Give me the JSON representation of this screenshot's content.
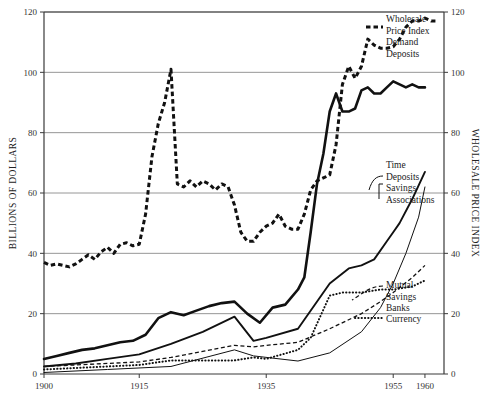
{
  "chart_data": {
    "type": "line",
    "title": "",
    "subtitle": "",
    "ylabel": "BILLIONS OF DOLLARS",
    "y2label": "WHOLESALE PRICE INDEX",
    "xlabel": "",
    "xlim": [
      1900,
      1963
    ],
    "ylim": [
      0,
      120
    ],
    "y2lim": [
      0,
      120
    ],
    "grid": true,
    "legend_position": "inline-right-labels",
    "yticks": [
      0,
      20,
      40,
      60,
      80,
      100,
      120
    ],
    "ytick_labels": [
      "0",
      "20",
      "40",
      "60",
      "80",
      "100",
      "120"
    ],
    "y2ticks": [
      0,
      20,
      40,
      60,
      80,
      100,
      120
    ],
    "y2tick_labels": [
      "0",
      "20",
      "40",
      "60",
      "80",
      "100",
      "120"
    ],
    "xticks": [
      1900,
      1915,
      1935,
      1955,
      1960
    ],
    "xtick_labels": [
      "1900",
      "1915",
      "1935",
      "1955",
      "1960"
    ],
    "series": [
      {
        "name": "Wholesale Price Index",
        "label": "Wholesale\nPrice Index",
        "style": "dashed-thick",
        "axis": "right",
        "color": "#111111",
        "x": [
          1900,
          1901,
          1902,
          1903,
          1904,
          1905,
          1906,
          1907,
          1908,
          1909,
          1910,
          1911,
          1912,
          1913,
          1914,
          1915,
          1916,
          1917,
          1918,
          1919,
          1920,
          1921,
          1922,
          1923,
          1924,
          1925,
          1926,
          1927,
          1928,
          1929,
          1930,
          1931,
          1932,
          1933,
          1934,
          1935,
          1936,
          1937,
          1938,
          1939,
          1940,
          1941,
          1942,
          1943,
          1944,
          1945,
          1946,
          1947,
          1948,
          1949,
          1950,
          1951,
          1952,
          1953,
          1954,
          1955,
          1956,
          1957,
          1958,
          1959,
          1960,
          1961,
          1962
        ],
        "values": [
          37,
          36,
          36.5,
          36,
          35.5,
          36.5,
          38,
          39.5,
          38,
          40.5,
          42,
          40,
          43,
          43.5,
          42.5,
          43,
          53,
          72,
          83,
          90,
          101,
          63,
          62,
          64,
          62,
          64,
          63,
          61,
          63,
          62,
          56,
          47,
          44,
          44,
          47,
          49,
          50,
          53,
          49,
          48,
          48,
          53,
          61,
          64,
          65,
          66,
          76,
          96,
          102,
          98,
          102,
          111,
          109,
          108,
          108,
          108.5,
          111,
          115,
          117,
          117,
          118,
          117,
          117
        ]
      },
      {
        "name": "Demand Deposits",
        "label": "Demand\nDeposits",
        "style": "solid-thick",
        "axis": "left",
        "color": "#111111",
        "x": [
          1900,
          1902,
          1904,
          1906,
          1908,
          1910,
          1912,
          1914,
          1916,
          1918,
          1920,
          1922,
          1924,
          1926,
          1928,
          1930,
          1932,
          1934,
          1936,
          1938,
          1940,
          1941,
          1942,
          1943,
          1944,
          1945,
          1946,
          1947,
          1948,
          1949,
          1950,
          1951,
          1952,
          1953,
          1954,
          1955,
          1956,
          1957,
          1958,
          1959,
          1960
        ],
        "values": [
          5,
          6,
          7,
          8,
          8.5,
          9.5,
          10.5,
          11,
          13,
          18.5,
          20.5,
          19.5,
          21,
          22.5,
          23.5,
          24,
          20,
          17,
          22,
          23,
          28,
          32,
          47,
          63,
          73,
          87,
          93,
          87,
          87,
          88,
          94,
          95,
          93,
          93,
          95,
          97,
          96,
          95,
          96,
          95,
          95
        ]
      },
      {
        "name": "Time Deposits",
        "label": "Time\nDeposits",
        "style": "solid-medium",
        "axis": "left",
        "color": "#111111",
        "x": [
          1900,
          1905,
          1910,
          1915,
          1920,
          1925,
          1930,
          1933,
          1935,
          1940,
          1945,
          1948,
          1950,
          1952,
          1954,
          1955,
          1956,
          1958,
          1960
        ],
        "values": [
          2.5,
          3.5,
          5,
          6.5,
          10,
          14,
          19,
          11,
          12,
          15,
          30,
          35,
          36,
          38,
          44,
          47,
          50,
          58,
          67
        ]
      },
      {
        "name": "Savings Associations",
        "label": "Savings\nAssociations",
        "style": "solid-thin",
        "axis": "left",
        "color": "#111111",
        "x": [
          1900,
          1910,
          1920,
          1930,
          1933,
          1940,
          1945,
          1950,
          1953,
          1955,
          1957,
          1959,
          1960
        ],
        "values": [
          0.5,
          1.5,
          2.5,
          8,
          6,
          4.3,
          7,
          14,
          22,
          30,
          40,
          52,
          62
        ]
      },
      {
        "name": "Mutual Savings Banks",
        "label": "Mutual\nSavings\nBanks",
        "style": "dashed-thin",
        "axis": "left",
        "color": "#111111",
        "x": [
          1900,
          1905,
          1910,
          1915,
          1920,
          1925,
          1930,
          1933,
          1935,
          1940,
          1945,
          1950,
          1953,
          1955,
          1958,
          1960
        ],
        "values": [
          2.5,
          3,
          3.5,
          4,
          5.5,
          7.5,
          9.5,
          9,
          9.5,
          10.5,
          15,
          20,
          24,
          27,
          32,
          36
        ]
      },
      {
        "name": "Currency",
        "label": "Currency",
        "style": "dotted",
        "axis": "left",
        "color": "#111111",
        "x": [
          1900,
          1905,
          1910,
          1915,
          1920,
          1925,
          1930,
          1933,
          1935,
          1940,
          1942,
          1945,
          1947,
          1950,
          1953,
          1955,
          1958,
          1960
        ],
        "values": [
          1.5,
          2,
          2.5,
          3,
          4.5,
          4.5,
          4.5,
          5.5,
          5,
          8,
          12,
          26,
          27,
          27,
          28,
          28,
          29,
          31
        ]
      }
    ]
  },
  "plot": {
    "left": 44,
    "right": 444,
    "top": 12,
    "bottom": 374
  }
}
